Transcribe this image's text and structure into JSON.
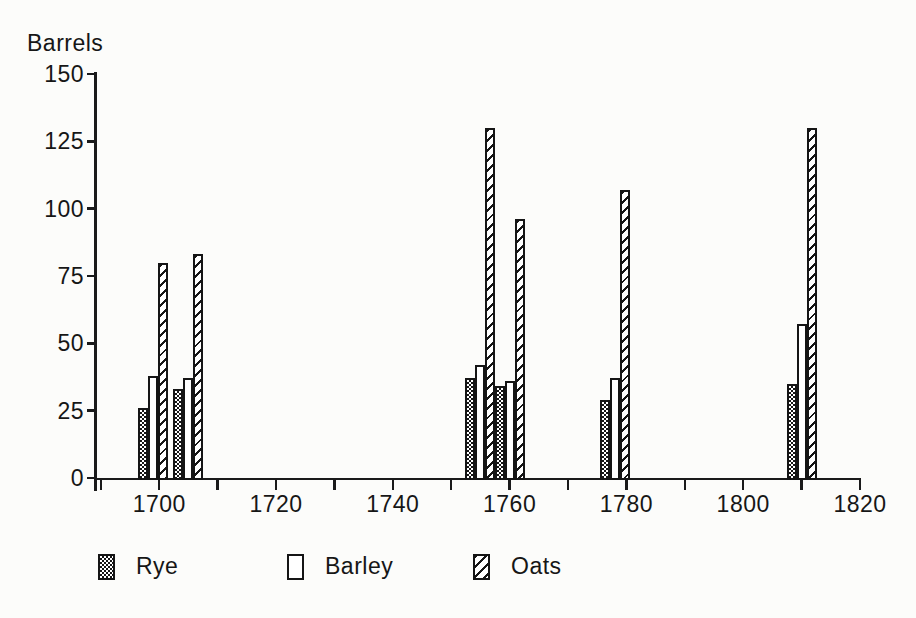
{
  "chart_data": {
    "type": "bar",
    "title": "",
    "ylabel": "Barrels",
    "xlabel": "",
    "ylim": [
      0,
      150
    ],
    "xlim": [
      1689,
      1820
    ],
    "y_ticks": [
      0,
      25,
      50,
      75,
      100,
      125,
      150
    ],
    "x_tick_start": 1690,
    "x_minor_tick_interval": 10,
    "x_tick_labels": [
      1700,
      1720,
      1740,
      1760,
      1780,
      1800,
      1820
    ],
    "x": [
      1699,
      1705,
      1755,
      1760,
      1778,
      1810
    ],
    "series": [
      {
        "name": "Rye",
        "pattern": "checker",
        "values": [
          26,
          33,
          37,
          34,
          29,
          35
        ]
      },
      {
        "name": "Barley",
        "pattern": "plain",
        "values": [
          38,
          37,
          42,
          36,
          37,
          57
        ]
      },
      {
        "name": "Oats",
        "pattern": "diagonal-hatch",
        "values": [
          80,
          83,
          130,
          96,
          107,
          130
        ]
      }
    ],
    "grid": false,
    "legend_position": "bottom",
    "bar_width_px": 10
  },
  "colors": {
    "ink": "#1a1a1a",
    "background": "#fcfcfa",
    "bar_fill": "#ffffff"
  }
}
